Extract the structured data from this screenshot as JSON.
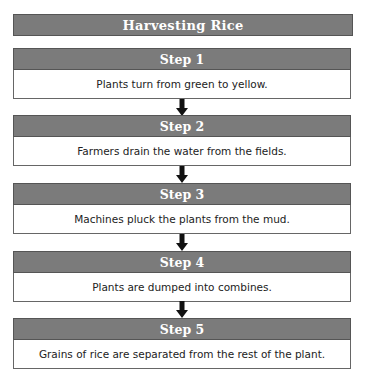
{
  "title": "Harvesting Rice",
  "steps": [
    {
      "label": "Step 1",
      "text": "Plants turn from green to yellow."
    },
    {
      "label": "Step 2",
      "text": "Farmers drain the water from the fields."
    },
    {
      "label": "Step 3",
      "text": "Machines pluck the plants from the mud."
    },
    {
      "label": "Step 4",
      "text": "Plants are dumped into combines."
    },
    {
      "label": "Step 5",
      "text": "Grains of rice are separated from the rest of the plant."
    }
  ],
  "colors": {
    "header_bg": "#7b7b7b",
    "header_text": "#ffffff",
    "arrow": "#111111"
  }
}
